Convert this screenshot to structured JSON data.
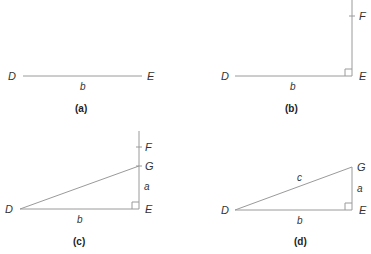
{
  "panels": [
    {
      "id": "a",
      "caption": "(a)",
      "points": {
        "D": "D",
        "E": "E"
      },
      "segments": {
        "b": "b"
      }
    },
    {
      "id": "b",
      "caption": "(b)",
      "points": {
        "D": "D",
        "E": "E",
        "F": "F"
      },
      "segments": {
        "b": "b"
      },
      "right_angle_at": "E"
    },
    {
      "id": "c",
      "caption": "(c)",
      "points": {
        "D": "D",
        "E": "E",
        "F": "F",
        "G": "G"
      },
      "segments": {
        "a": "a",
        "b": "b"
      },
      "right_angle_at": "E"
    },
    {
      "id": "d",
      "caption": "(d)",
      "points": {
        "D": "D",
        "E": "E",
        "G": "G"
      },
      "segments": {
        "a": "a",
        "b": "b",
        "c": "c"
      },
      "right_angle_at": "E"
    }
  ]
}
